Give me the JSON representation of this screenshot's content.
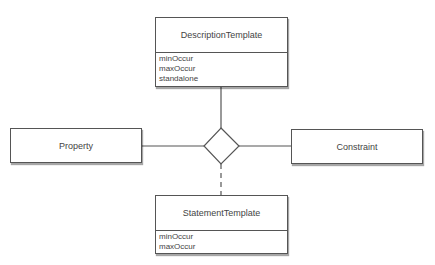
{
  "diagram": {
    "type": "entity-relationship",
    "nodes": {
      "description_template": {
        "title": "DescriptionTemplate",
        "attributes": [
          "minOccur",
          "maxOccur",
          "standalone"
        ]
      },
      "property": {
        "title": "Property"
      },
      "constraint": {
        "title": "Constraint"
      },
      "statement_template": {
        "title": "StatementTemplate",
        "attributes": [
          "minOccur",
          "maxOccur"
        ]
      },
      "relationship": {
        "shape": "diamond"
      }
    },
    "edges": [
      {
        "from": "description_template",
        "to": "relationship",
        "style": "solid"
      },
      {
        "from": "property",
        "to": "relationship",
        "style": "solid"
      },
      {
        "from": "constraint",
        "to": "relationship",
        "style": "solid"
      },
      {
        "from": "statement_template",
        "to": "relationship",
        "style": "dashed"
      }
    ],
    "colors": {
      "stroke": "#555555",
      "text": "#444444",
      "background": "#ffffff"
    }
  }
}
